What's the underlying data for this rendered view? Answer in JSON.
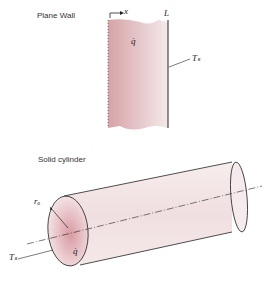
{
  "plane_wall": {
    "title": "Plane Wall",
    "axis_label": "x",
    "thickness_label": "L",
    "generation_label": "q̇",
    "surface_temp_label": "Tₛ"
  },
  "cylinder": {
    "title": "Solid cylinder",
    "radius_label": "rₒ",
    "generation_label": "q̇",
    "surface_temp_label": "Tₛ"
  },
  "colors": {
    "fill_dark": "#d9a9ad",
    "fill_light": "#f3e6e7",
    "stroke": "#222222"
  }
}
